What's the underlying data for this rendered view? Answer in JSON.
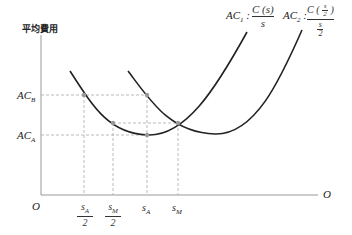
{
  "y_axis_label": "平均費用",
  "origin_label": "O",
  "x_axis_end_label": "O",
  "y_ticks": [
    {
      "name": "AC",
      "sub": "B"
    },
    {
      "name": "AC",
      "sub": "A"
    }
  ],
  "x_ticks": [
    {
      "num": "s",
      "sub": "A",
      "den": "2"
    },
    {
      "num": "s",
      "sub": "M",
      "den": "2"
    },
    {
      "num": "s",
      "sub": "A"
    },
    {
      "num": "s",
      "sub": "M"
    }
  ],
  "curves": [
    {
      "name": "AC",
      "sub": "1",
      "formula_num": "C (s)",
      "formula_den": "s"
    },
    {
      "name": "AC",
      "sub": "2",
      "formula_num": "C ( s/2 )",
      "formula_den": "s/2"
    }
  ],
  "colors": {
    "curve": "#222222",
    "axis": "#888888",
    "dash": "#999999",
    "point": "#999999"
  }
}
